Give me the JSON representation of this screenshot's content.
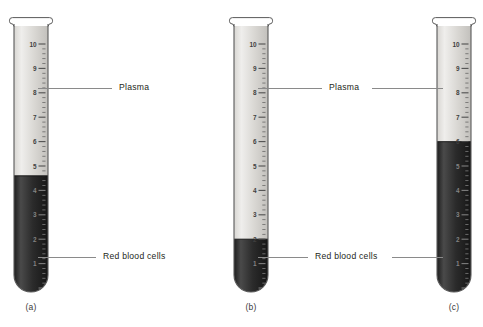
{
  "figure": {
    "background_color": "#ffffff",
    "width": 483,
    "height": 327
  },
  "labels": {
    "plasma": "Plasma",
    "red_blood_cells": "Red blood cells"
  },
  "captions": {
    "a": "(a)",
    "b": "(b)",
    "c": "(c)"
  },
  "scale": {
    "ticks_major": [
      "10",
      "9",
      "8",
      "7",
      "6",
      "5",
      "4",
      "3",
      "2",
      "1"
    ],
    "minor_per_major": 5,
    "max": 10,
    "min": 0
  },
  "colors": {
    "plasma_fill": "#d8d6d2",
    "plasma_fill_light": "#efeeec",
    "red_cells_fill": "#2b2b2b",
    "red_cells_fill_light": "#4a4a4a",
    "glass_outline": "#5a5a5a",
    "tick_color": "#4a4a4a",
    "leader_color": "#8a8a8a",
    "text_color": "#231f20"
  },
  "tubes": [
    {
      "id": "a",
      "caption": "(a)",
      "x": 14,
      "width": 34,
      "top": 20,
      "bottom": 292,
      "scale_top_value": 10,
      "scale_visible_from": 10,
      "scale_visible_to": 5,
      "packed_cell_level": 4.6,
      "plasma_level": 10,
      "hematocrit_percent": 46,
      "plasma_callout_value": 8.4,
      "rbc_callout_value": 1.5
    },
    {
      "id": "b",
      "caption": "(b)",
      "x": 234,
      "width": 34,
      "top": 20,
      "bottom": 292,
      "scale_top_value": 10,
      "scale_visible_from": 10,
      "scale_visible_to": 2,
      "packed_cell_level": 2.0,
      "plasma_level": 10,
      "hematocrit_percent": 20,
      "plasma_callout_value": 8.4,
      "rbc_callout_value": 1.1
    },
    {
      "id": "c",
      "caption": "(c)",
      "x": 437,
      "width": 34,
      "top": 20,
      "bottom": 292,
      "scale_top_value": 10,
      "scale_visible_from": 10,
      "scale_visible_to": 6,
      "packed_cell_level": 6.0,
      "plasma_level": 10,
      "hematocrit_percent": 60,
      "plasma_callout_value": 8.4,
      "rbc_callout_value": 1.4
    }
  ],
  "callouts": [
    {
      "id": "plasma-a",
      "label": "Plasma",
      "target_tube": "a",
      "y": 88,
      "line_x1": 38,
      "line_x2": 112,
      "label_x": 116
    },
    {
      "id": "rbc-a",
      "label": "Red blood cells",
      "target_tube": "a",
      "y": 257,
      "line_x1": 38,
      "line_x2": 96,
      "label_x": 100
    },
    {
      "id": "plasma-bc",
      "label": "Plasma",
      "target_tube": "b,c",
      "y": 88,
      "line_x1": 258,
      "line_x2": 322,
      "line2_x1": 372,
      "line2_x2": 443,
      "label_x": 326
    },
    {
      "id": "rbc-bc",
      "label": "Red blood cells",
      "target_tube": "b,c",
      "y": 257,
      "line_x1": 258,
      "line_x2": 308,
      "line2_x1": 392,
      "line2_x2": 443,
      "label_x": 312
    }
  ]
}
